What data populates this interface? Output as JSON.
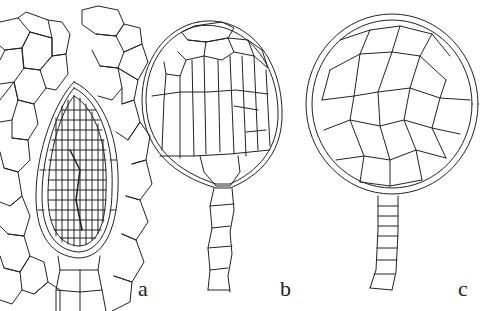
{
  "figure": {
    "panels": [
      {
        "id": "a",
        "label": "a",
        "subject": "ovoid gametangium with finely divided cells embedded in surrounding tissue"
      },
      {
        "id": "b",
        "label": "b",
        "subject": "stalked globose body with elongated vertical cells"
      },
      {
        "id": "c",
        "label": "c",
        "subject": "stalked globose body with polygonal cells and uniseriate stalk"
      }
    ],
    "colors": {
      "line": "#222222",
      "background": "#ffffff"
    }
  }
}
